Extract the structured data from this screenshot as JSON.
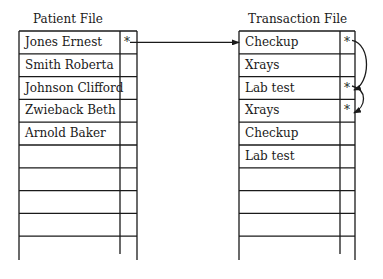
{
  "patient_file": {
    "title": "Patient File",
    "rows": [
      {
        "name": "Jones Ernest",
        "pointer": "*"
      },
      {
        "name": "Smith Roberta",
        "pointer": ""
      },
      {
        "name": "Johnson Clifford",
        "pointer": ""
      },
      {
        "name": "Zwieback Beth",
        "pointer": ""
      },
      {
        "name": "Arnold Baker",
        "pointer": ""
      },
      {
        "name": "",
        "pointer": ""
      },
      {
        "name": "",
        "pointer": ""
      },
      {
        "name": "",
        "pointer": ""
      },
      {
        "name": "",
        "pointer": ""
      }
    ]
  },
  "transaction_file": {
    "title": "Transaction File",
    "rows": [
      {
        "name": "Checkup",
        "pointer": "*"
      },
      {
        "name": "Xrays",
        "pointer": ""
      },
      {
        "name": "Lab test",
        "pointer": "*"
      },
      {
        "name": "Xrays",
        "pointer": "*"
      },
      {
        "name": "Checkup",
        "pointer": ""
      },
      {
        "name": "Lab test",
        "pointer": ""
      },
      {
        "name": "",
        "pointer": ""
      },
      {
        "name": "",
        "pointer": ""
      },
      {
        "name": "",
        "pointer": ""
      }
    ]
  },
  "links": [
    {
      "from": "patient_file.0",
      "to": "transaction_file.0"
    },
    {
      "from": "transaction_file.0",
      "to": "transaction_file.2"
    },
    {
      "from": "transaction_file.2",
      "to": "transaction_file.3"
    }
  ]
}
